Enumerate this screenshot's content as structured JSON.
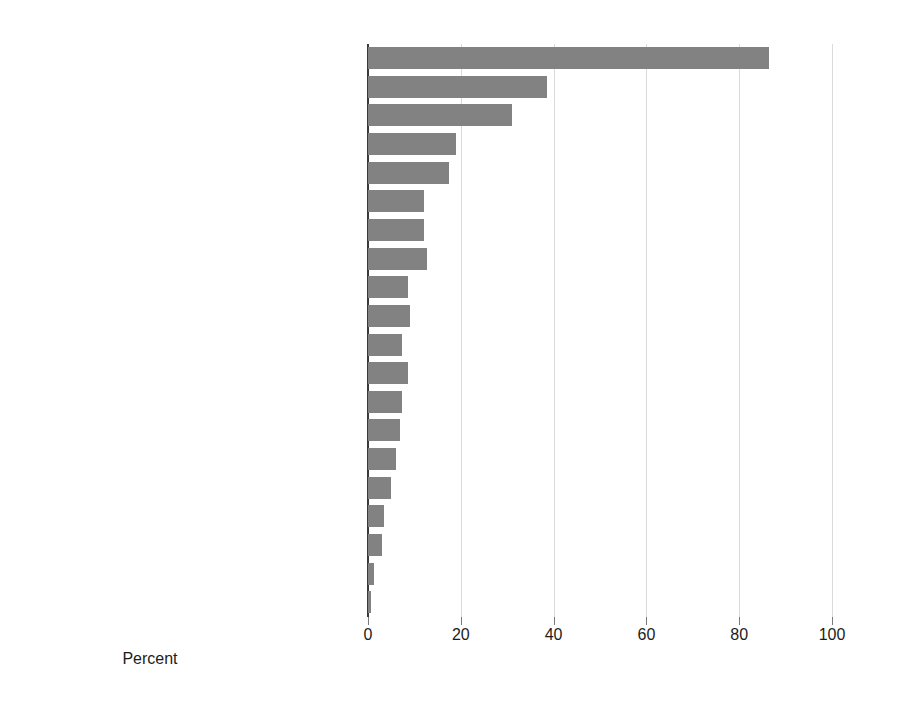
{
  "chart_data": {
    "type": "bar",
    "orientation": "horizontal",
    "title": "",
    "subtitle": "",
    "xlabel": "Percent",
    "ylabel": "",
    "xlim": [
      0,
      100
    ],
    "xticks": [
      0,
      20,
      40,
      60,
      80,
      100
    ],
    "xtick_labels": [
      "0",
      "20",
      "40",
      "60",
      "80",
      "100"
    ],
    "grid": "vertical",
    "legend": "none",
    "bar_color": "#828282",
    "gridline_color": "#dadada",
    "axis_color": "#3a3a3a",
    "categories": [
      "Hypertension",
      "Diabetes, with insulin",
      "Congestive heart failure",
      "Atherosclerotic heart disease",
      "Other cardiac disease",
      "Peripheral vascular disease",
      "Diabetes, with oral medication",
      "Needs assistance with daily activities",
      "Cerebrovascular disease",
      "Chronic obstructive pulmonary disease",
      "Diabetic retinopathy",
      "Institutionalized",
      "Cancer",
      "Inability to ambulate",
      "Tobacco use",
      "Diabetes, without medication",
      "Inability to transfer",
      "Amputation",
      "Alcohol dependence",
      "Drug dependence"
    ],
    "values": [
      86.5,
      38.5,
      31.0,
      19.0,
      17.5,
      12.0,
      12.0,
      12.7,
      8.6,
      9.0,
      7.3,
      8.6,
      7.3,
      7.0,
      6.0,
      5.0,
      3.5,
      3.0,
      1.3,
      0.7
    ]
  }
}
